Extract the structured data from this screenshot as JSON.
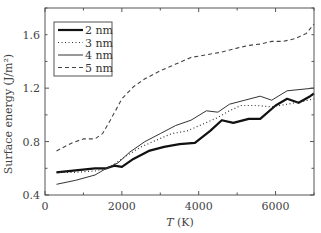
{
  "chart_data": {
    "type": "line",
    "title": "",
    "xlabel": "T (K)",
    "ylabel": "Surface energy (J/m²)",
    "xlim": [
      0,
      7000
    ],
    "ylim": [
      0.4,
      1.8
    ],
    "xticks": [
      0,
      2000,
      4000,
      6000
    ],
    "xtick_labels": [
      "0",
      "2000",
      "4000",
      "6000"
    ],
    "yticks": [
      0.4,
      0.8,
      1.2,
      1.6
    ],
    "ytick_labels": [
      "0.4",
      "0.8",
      "1.2",
      "1.6"
    ],
    "grid": false,
    "legend_position": "upper left",
    "series": [
      {
        "name": "2 nm",
        "style": "solid-thick",
        "x": [
          300,
          800,
          1300,
          1600,
          1800,
          2000,
          2300,
          2700,
          3100,
          3500,
          3900,
          4300,
          4600,
          4900,
          5300,
          5600,
          6000,
          6300,
          6600,
          6900,
          7000
        ],
        "y": [
          0.57,
          0.585,
          0.6,
          0.6,
          0.62,
          0.61,
          0.67,
          0.73,
          0.76,
          0.78,
          0.79,
          0.88,
          0.96,
          0.94,
          0.97,
          0.97,
          1.07,
          1.12,
          1.09,
          1.14,
          1.16
        ]
      },
      {
        "name": "3 nm",
        "style": "dotted",
        "x": [
          300,
          800,
          1300,
          1600,
          1800,
          2100,
          2500,
          2900,
          3300,
          3700,
          4100,
          4500,
          4800,
          5100,
          5500,
          5900,
          6300,
          6700,
          7000
        ],
        "y": [
          0.57,
          0.57,
          0.58,
          0.6,
          0.63,
          0.69,
          0.76,
          0.81,
          0.86,
          0.88,
          0.93,
          0.98,
          1.03,
          1.07,
          1.07,
          1.06,
          1.08,
          1.1,
          1.12
        ]
      },
      {
        "name": "4 nm",
        "style": "solid-thin",
        "x": [
          300,
          800,
          1300,
          1600,
          1900,
          2200,
          2600,
          3000,
          3400,
          3800,
          4200,
          4500,
          4800,
          5200,
          5600,
          5900,
          6300,
          7000
        ],
        "y": [
          0.48,
          0.51,
          0.55,
          0.6,
          0.64,
          0.72,
          0.8,
          0.86,
          0.92,
          0.96,
          1.03,
          1.02,
          1.08,
          1.11,
          1.14,
          1.11,
          1.18,
          1.2
        ]
      },
      {
        "name": "5 nm",
        "style": "dashed",
        "x": [
          300,
          700,
          1000,
          1300,
          1500,
          1700,
          2000,
          2300,
          2600,
          3000,
          3400,
          3800,
          4200,
          4600,
          5000,
          5300,
          5600,
          5900,
          6200,
          6500,
          6800,
          7000
        ],
        "y": [
          0.73,
          0.79,
          0.82,
          0.82,
          0.86,
          0.96,
          1.12,
          1.21,
          1.27,
          1.33,
          1.38,
          1.43,
          1.45,
          1.47,
          1.5,
          1.52,
          1.53,
          1.55,
          1.55,
          1.57,
          1.61,
          1.68
        ]
      }
    ]
  }
}
